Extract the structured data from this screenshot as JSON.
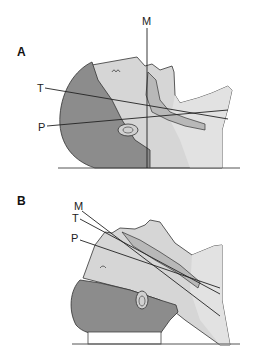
{
  "colors": {
    "hair": "#8a8a8a",
    "hair_dark": "#7a7a7a",
    "skin": "#cfcfcf",
    "skin_light": "#dedede",
    "airway": "#b5b5b5",
    "line": "#222222",
    "outline": "#333333",
    "ground": "#555555",
    "background": "#ffffff"
  },
  "panels": [
    {
      "id": "A",
      "label": "A",
      "description": "Head in neutral supine position; oral (M), pharyngeal (P) and tracheal (T) axes poorly aligned",
      "axes": [
        {
          "label": "M",
          "name": "mouth-axis"
        },
        {
          "label": "T",
          "name": "tracheal-axis"
        },
        {
          "label": "P",
          "name": "pharyngeal-axis"
        }
      ]
    },
    {
      "id": "B",
      "label": "B",
      "description": "Sniffing position with head elevated on pad; M, T and P axes nearly aligned",
      "axes": [
        {
          "label": "M",
          "name": "mouth-axis"
        },
        {
          "label": "T",
          "name": "tracheal-axis"
        },
        {
          "label": "P",
          "name": "pharyngeal-axis"
        }
      ]
    }
  ]
}
